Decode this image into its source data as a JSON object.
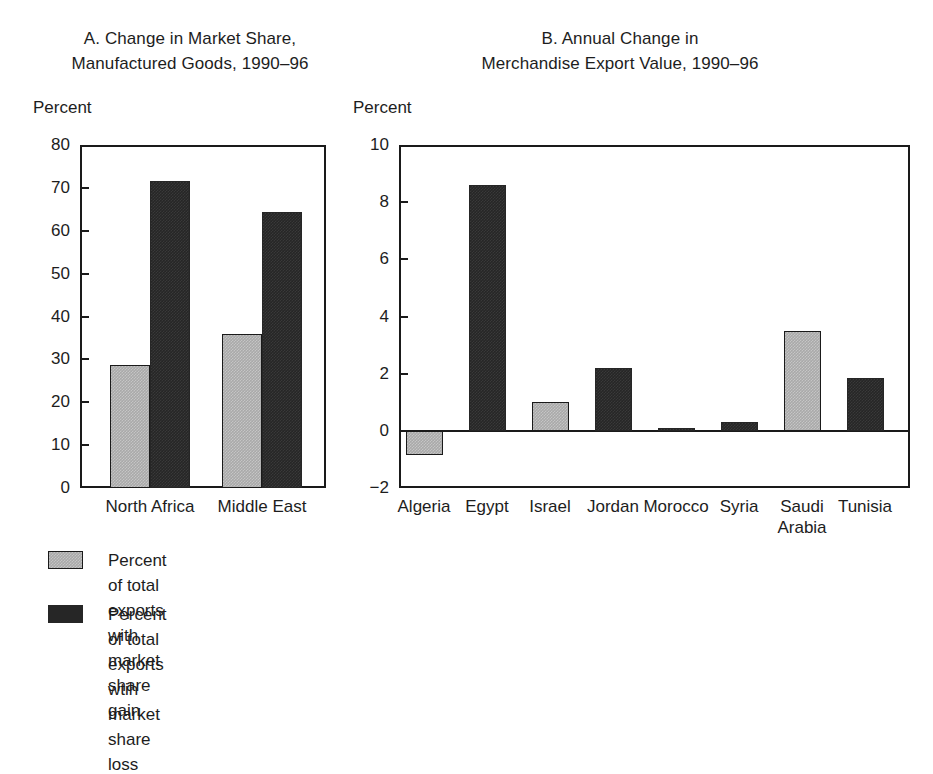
{
  "figure": {
    "background": "#ffffff",
    "ink_color": "#1d1d1d",
    "series_colors": {
      "gain": "#a9a9a9",
      "loss": "#262626"
    }
  },
  "panel_a": {
    "title": "A. Change in Market Share,\nManufactured Goods, 1990–96",
    "axis_caption": "Percent",
    "ytick_labels": [
      "80",
      "70",
      "60",
      "50",
      "40",
      "30",
      "20",
      "10",
      "0"
    ],
    "xtick_labels": [
      "North Africa",
      "Middle East"
    ]
  },
  "panel_b": {
    "title": "B. Annual Change in\nMerchandise Export Value, 1990–96",
    "axis_caption": "Percent",
    "ytick_labels": [
      "10",
      "8",
      "6",
      "4",
      "2",
      "0",
      "−2"
    ],
    "xtick_labels": [
      "Algeria",
      "Egypt",
      "Israel",
      "Jordan",
      "Morocco",
      "Syria",
      "Saudi\nArabia",
      "Tunisia"
    ]
  },
  "legend": {
    "items": [
      {
        "swatch": "gain",
        "label": "Percent of total exports with\nmarket share gain"
      },
      {
        "swatch": "loss",
        "label": "Percent of total exports wtih\nmarket share loss"
      }
    ]
  },
  "chart_data": [
    {
      "type": "bar",
      "panel": "A",
      "title": "A. Change in Market Share, Manufactured Goods, 1990–96",
      "xlabel": "",
      "ylabel": "Percent",
      "ylim": [
        0,
        80
      ],
      "yticks": [
        0,
        10,
        20,
        30,
        40,
        50,
        60,
        70,
        80
      ],
      "grid": false,
      "legend_position": "below-figure",
      "categories": [
        "North Africa",
        "Middle East"
      ],
      "series": [
        {
          "name": "Percent of total exports with market share gain",
          "color": "#a9a9a9",
          "values": [
            28.7,
            36.0
          ]
        },
        {
          "name": "Percent of total exports wtih market share loss",
          "color": "#262626",
          "values": [
            71.7,
            64.3
          ]
        }
      ]
    },
    {
      "type": "bar",
      "panel": "B",
      "title": "B. Annual Change in Merchandise Export Value, 1990–96",
      "xlabel": "",
      "ylabel": "Percent",
      "ylim": [
        -2,
        10
      ],
      "yticks": [
        -2,
        0,
        2,
        4,
        6,
        8,
        10
      ],
      "grid": false,
      "zero_line": true,
      "categories": [
        "Algeria",
        "Egypt",
        "Israel",
        "Jordan",
        "Morocco",
        "Syria",
        "Saudi Arabia",
        "Tunisia"
      ],
      "values": [
        -0.85,
        8.6,
        1.0,
        2.2,
        0.1,
        0.3,
        3.5,
        1.85
      ],
      "bar_colors": [
        "#a9a9a9",
        "#262626",
        "#a9a9a9",
        "#262626",
        "#262626",
        "#262626",
        "#a9a9a9",
        "#262626"
      ],
      "bar_series": [
        "gain",
        "loss",
        "gain",
        "loss",
        "loss",
        "loss",
        "gain",
        "loss"
      ]
    }
  ],
  "geometry": {
    "panel_a": {
      "plot": {
        "left": 80,
        "top": 145,
        "width": 246,
        "height": 343
      },
      "y_top_value": 80,
      "y_bottom_value": 0,
      "bars": [
        {
          "left": 110,
          "width": 40,
          "value": 28.7,
          "series": "gain"
        },
        {
          "left": 150,
          "width": 40,
          "value": 71.7,
          "series": "loss"
        },
        {
          "left": 222,
          "width": 40,
          "value": 36.0,
          "series": "gain"
        },
        {
          "left": 262,
          "width": 40,
          "value": 64.3,
          "series": "loss"
        }
      ],
      "group_centers": [
        150,
        262
      ]
    },
    "panel_b": {
      "plot": {
        "left": 399,
        "top": 145,
        "width": 511,
        "height": 343
      },
      "y_top_value": 10,
      "y_bottom_value": -2,
      "zero_y": 430,
      "bars": [
        {
          "center": 424,
          "width": 37,
          "value": -0.85,
          "series": "gain"
        },
        {
          "center": 487,
          "width": 37,
          "value": 8.6,
          "series": "loss"
        },
        {
          "center": 550,
          "width": 37,
          "value": 1.0,
          "series": "gain"
        },
        {
          "center": 613,
          "width": 37,
          "value": 2.2,
          "series": "loss"
        },
        {
          "center": 676,
          "width": 37,
          "value": 0.1,
          "series": "loss"
        },
        {
          "center": 739,
          "width": 37,
          "value": 0.3,
          "series": "loss"
        },
        {
          "center": 802,
          "width": 37,
          "value": 3.5,
          "series": "gain"
        },
        {
          "center": 865,
          "width": 37,
          "value": 1.85,
          "series": "loss"
        }
      ]
    }
  }
}
